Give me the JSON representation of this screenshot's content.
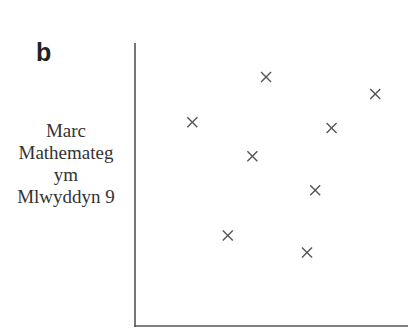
{
  "panel": {
    "label": "b"
  },
  "chart_data": {
    "type": "scatter",
    "title": "",
    "xlabel": "",
    "ylabel": "Marc Mathemateg ym Mlwyddyn 9",
    "ylabel_lines": [
      "Marc",
      "Mathemateg",
      "ym",
      "Mlwyddyn 9"
    ],
    "marker": "x",
    "grid": false,
    "axes": {
      "ticks": false,
      "xlim": [
        0,
        10
      ],
      "ylim": [
        0,
        10
      ]
    },
    "points": [
      {
        "x": 2.1,
        "y": 7.2
      },
      {
        "x": 4.8,
        "y": 8.8
      },
      {
        "x": 4.3,
        "y": 6.0
      },
      {
        "x": 3.4,
        "y": 3.2
      },
      {
        "x": 7.2,
        "y": 7.0
      },
      {
        "x": 6.6,
        "y": 4.8
      },
      {
        "x": 6.3,
        "y": 2.6
      },
      {
        "x": 8.8,
        "y": 8.2
      }
    ],
    "colors": {
      "axis": "#555555",
      "marker": "#555555"
    }
  }
}
